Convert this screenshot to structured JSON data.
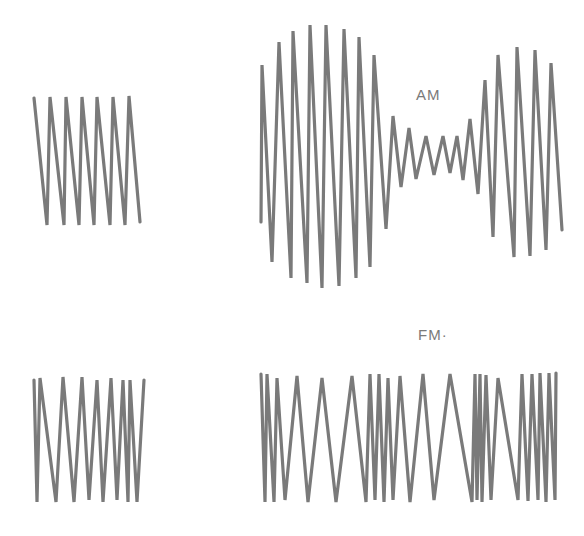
{
  "labels": {
    "am": "AM",
    "fm": "FM·"
  },
  "colors": {
    "stroke": "#7a7a7a",
    "background": "#ffffff"
  },
  "waves": {
    "carrier_top": "34,98 47,225 50,97 64,225 66,97 79,225 82,97 94,225 97,97 110,225 113,97 125,225 129,96 140,222",
    "am_signal": "261,222 262,65 272,262 279,42 291,278 293,31 307,283 310,25 322,288 326,25 339,286 344,29 356,278 359,37 370,267 374,55 386,229 393,116 401,187 409,128 416,179 426,136 434,175 443,136 450,173 457,136 463,180 470,119 478,194 485,80 493,237 498,55 514,257 517,47 530,256 535,50 546,250 551,63 562,230",
    "carrier_bottom": "34,380 37,502 40,378 56,502 63,377 74,502 82,377 89,500 97,380 103,502 111,378 117,500 123,380 128,502 130,380 137,502 144,380",
    "fm_signal": "261,374 265,502 267,374 274,502 277,378 285,500 297,376 308,502 322,378 336,502 352,376 366,502 370,374 375,500 379,374 384,502 388,378 393,500 400,376 410,502 423,374 434,500 450,374 472,502 475,374 477,500 480,374 482,502 486,375 491,500 498,378 518,500 522,374 528,501 532,374 538,500 540,373 546,502 549,373 555,500 556,373"
  }
}
